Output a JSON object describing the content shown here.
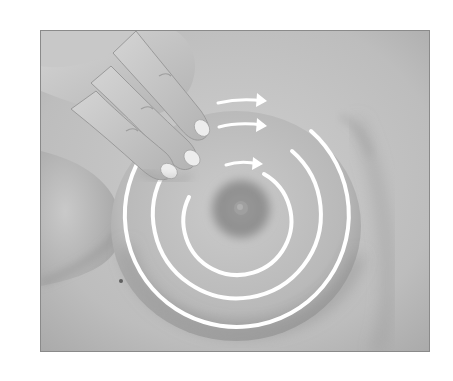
{
  "figure": {
    "type": "grayscale-photo-illustration",
    "alt_text": "Three fingers pressing on the breast with three concentric white circles and arrows indicating a clockwise circular examination pattern",
    "frame": {
      "x": 40,
      "y": 30,
      "width": 390,
      "height": 322,
      "border_color": "#8a8a8a"
    },
    "colors": {
      "background": "#ffffff",
      "skin_light": "#cfcfcf",
      "skin_mid": "#b5b5b5",
      "skin_shadow": "#8f8f8f",
      "areola": "#8c8c8c",
      "nipple": "#9c9c9c",
      "annotation": "#ffffff",
      "nail": "#efefef"
    },
    "annotations": {
      "center": [
        192,
        185
      ],
      "rings": [
        {
          "name": "inner-ring",
          "radius": 54,
          "arrow": "clockwise"
        },
        {
          "name": "middle-ring",
          "radius": 84,
          "arrow": "clockwise"
        },
        {
          "name": "outer-ring",
          "radius": 112,
          "arrow": "clockwise"
        }
      ],
      "arrow_count": 3
    },
    "fingers_count": 3
  }
}
